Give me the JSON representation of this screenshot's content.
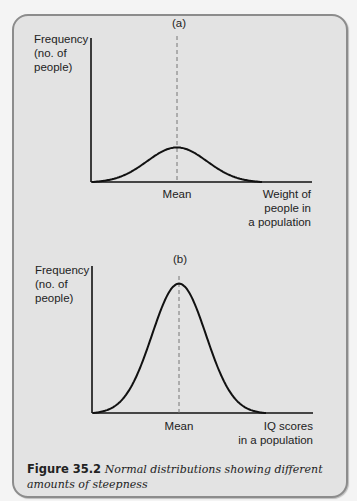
{
  "caption": {
    "label": "Figure 35.2",
    "text": "Normal distributions showing different amounts of steepness"
  },
  "chart_data": [
    {
      "type": "line",
      "panel_label": "(a)",
      "title": "(a)",
      "ylabel_lines": [
        "Frequency",
        "(no. of",
        "people)"
      ],
      "xlabel_lines": [
        "Weight of",
        "people in",
        "a population"
      ],
      "x_tick_labels": [
        "Mean"
      ],
      "mean_marker": "dashed vertical line at Mean",
      "curve": {
        "distribution": "normal",
        "relative_peak_height": 0.24,
        "relative_spread": "wide"
      },
      "xlim": [
        0,
        1
      ],
      "ylim": [
        0,
        1
      ],
      "grid": false
    },
    {
      "type": "line",
      "panel_label": "(b)",
      "title": "(b)",
      "ylabel_lines": [
        "Frequency",
        "(no. of",
        "people)"
      ],
      "xlabel_lines": [
        "IQ scores",
        "in a population"
      ],
      "x_tick_labels": [
        "Mean"
      ],
      "mean_marker": "dashed vertical line at Mean",
      "curve": {
        "distribution": "normal",
        "relative_peak_height": 0.88,
        "relative_spread": "narrow"
      },
      "xlim": [
        0,
        1
      ],
      "ylim": [
        0,
        1
      ],
      "grid": false
    }
  ]
}
